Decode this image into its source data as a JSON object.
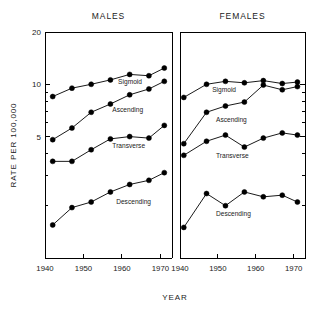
{
  "chart_data": {
    "type": "line",
    "title": "",
    "xlabel": "YEAR",
    "ylabel": "RATE PER 100,000",
    "xlim": [
      1940,
      1973
    ],
    "ylim": [
      1.0,
      20
    ],
    "yscale": "log",
    "xticks": [
      1940,
      1950,
      1960,
      1970
    ],
    "yticks": [
      5,
      10,
      20
    ],
    "ytick_labels": [
      "5",
      "10",
      "20"
    ],
    "grid": false,
    "legend_position": "inline-labels",
    "panels": [
      {
        "name": "males",
        "title": "MALES",
        "series": [
          {
            "name": "Sigmoid",
            "label": "Sigmoid",
            "x": [
              1942,
              1947,
              1952,
              1957,
              1962,
              1967,
              1971
            ],
            "values": [
              8.5,
              9.5,
              10.0,
              10.6,
              11.4,
              11.2,
              12.4
            ]
          },
          {
            "name": "Ascending",
            "label": "Ascending",
            "x": [
              1942,
              1947,
              1952,
              1957,
              1962,
              1967,
              1971
            ],
            "values": [
              4.8,
              5.6,
              6.9,
              7.7,
              8.7,
              9.4,
              10.4
            ]
          },
          {
            "name": "Transverse",
            "label": "Transverse",
            "x": [
              1942,
              1947,
              1952,
              1957,
              1962,
              1967,
              1971
            ],
            "values": [
              3.6,
              3.6,
              4.2,
              4.85,
              5.0,
              4.9,
              5.8
            ]
          },
          {
            "name": "Descending",
            "label": "Descending",
            "x": [
              1942,
              1947,
              1952,
              1957,
              1962,
              1967,
              1971
            ],
            "values": [
              1.55,
              1.95,
              2.1,
              2.4,
              2.65,
              2.8,
              3.1
            ]
          }
        ]
      },
      {
        "name": "females",
        "title": "FEMALES",
        "series": [
          {
            "name": "Sigmoid",
            "label": "Sigmoid",
            "x": [
              1941,
              1947,
              1952,
              1957,
              1962,
              1967,
              1971
            ],
            "values": [
              8.4,
              10.0,
              10.4,
              10.2,
              10.5,
              10.1,
              10.3
            ]
          },
          {
            "name": "Ascending",
            "label": "Ascending",
            "x": [
              1941,
              1947,
              1952,
              1957,
              1962,
              1967,
              1971
            ],
            "values": [
              4.55,
              6.9,
              7.5,
              7.9,
              9.9,
              9.3,
              9.7
            ]
          },
          {
            "name": "Transverse",
            "label": "Transverse",
            "x": [
              1941,
              1947,
              1952,
              1957,
              1962,
              1967,
              1971
            ],
            "values": [
              3.9,
              4.7,
              5.1,
              4.35,
              4.9,
              5.25,
              5.1
            ]
          },
          {
            "name": "Descending",
            "label": "Descending",
            "x": [
              1941,
              1947,
              1952,
              1957,
              1962,
              1967,
              1971
            ],
            "values": [
              1.5,
              2.35,
              2.0,
              2.4,
              2.25,
              2.3,
              2.1
            ]
          }
        ]
      }
    ],
    "series_label_positions": {
      "males": {
        "Sigmoid": [
          1959,
          10.0
        ],
        "Ascending": [
          1957.5,
          6.9
        ],
        "Transverse": [
          1957.5,
          4.3
        ],
        "Descending": [
          1958.5,
          2.05
        ]
      },
      "females": {
        "Sigmoid": [
          1948.5,
          9.0
        ],
        "Ascending": [
          1949.5,
          6.1
        ],
        "Transverse": [
          1949.5,
          3.75
        ],
        "Descending": [
          1949.5,
          1.75
        ]
      }
    }
  }
}
